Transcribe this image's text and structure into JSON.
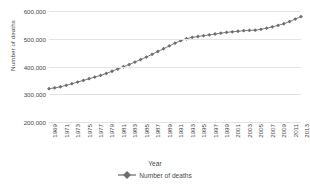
{
  "chart_data": {
    "type": "line",
    "title": "",
    "xlabel": "Year",
    "ylabel": "Number of deaths",
    "legend": [
      "Number of deaths"
    ],
    "legend_position": "bottom",
    "grid": true,
    "series_color": "#7f7f7f",
    "marker": "diamond",
    "xlim": [
      1969,
      2013
    ],
    "ylim": [
      200000,
      600000
    ],
    "ytick_labels": [
      "600,000",
      "500,000",
      "400,000",
      "300,000",
      "200,000"
    ],
    "ytick_values": [
      600000,
      500000,
      400000,
      300000,
      200000
    ],
    "xtick_labels": [
      "1969",
      "1971",
      "1973",
      "1975",
      "1977",
      "1979",
      "1981",
      "1983",
      "1985",
      "1987",
      "1989",
      "1991",
      "1993",
      "1995",
      "1997",
      "1999",
      "2001",
      "2003",
      "2005",
      "2007",
      "2009",
      "2011",
      "2013"
    ],
    "x": [
      1969,
      1970,
      1971,
      1972,
      1973,
      1974,
      1975,
      1976,
      1977,
      1978,
      1979,
      1980,
      1981,
      1982,
      1983,
      1984,
      1985,
      1986,
      1987,
      1988,
      1989,
      1990,
      1991,
      1992,
      1993,
      1994,
      1995,
      1996,
      1997,
      1998,
      1999,
      2000,
      2001,
      2002,
      2003,
      2004,
      2005,
      2006,
      2007,
      2008,
      2009,
      2010,
      2011,
      2012,
      2013
    ],
    "values": [
      320000,
      323000,
      327000,
      332000,
      338000,
      344000,
      350000,
      356000,
      362000,
      368000,
      375000,
      383000,
      391000,
      399000,
      407000,
      416000,
      425000,
      434000,
      444000,
      454000,
      464000,
      474000,
      484000,
      493000,
      500000,
      505000,
      508000,
      511000,
      514000,
      517000,
      520000,
      523000,
      525000,
      527000,
      529000,
      530000,
      531000,
      534000,
      538000,
      543000,
      548000,
      554000,
      562000,
      571000,
      580000
    ]
  },
  "legend": {
    "marker_name": "line-diamond-marker"
  }
}
